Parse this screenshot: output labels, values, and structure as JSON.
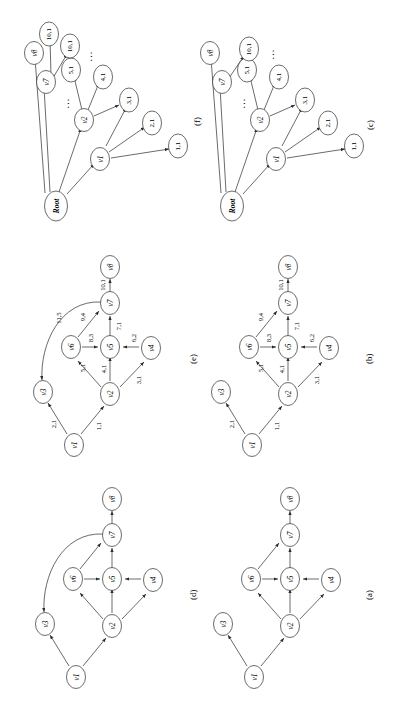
{
  "figure": {
    "orientation_degrees": -90,
    "background": "#ffffff",
    "stroke_color": "#2b2b2b",
    "panels": [
      {
        "id": "a",
        "caption": "(a)",
        "type": "directed-graph",
        "nodes": [
          "v1",
          "v2",
          "v3",
          "v4",
          "v5",
          "v6",
          "v7",
          "v8"
        ],
        "edges": [
          {
            "from": "v1",
            "to": "v3"
          },
          {
            "from": "v1",
            "to": "v2"
          },
          {
            "from": "v2",
            "to": "v6"
          },
          {
            "from": "v2",
            "to": "v5"
          },
          {
            "from": "v2",
            "to": "v4"
          },
          {
            "from": "v6",
            "to": "v5"
          },
          {
            "from": "v4",
            "to": "v5"
          },
          {
            "from": "v5",
            "to": "v7"
          },
          {
            "from": "v6",
            "to": "v7"
          },
          {
            "from": "v7",
            "to": "v8"
          }
        ]
      },
      {
        "id": "b",
        "caption": "(b)",
        "type": "weighted-directed-graph",
        "nodes": [
          "v1",
          "v2",
          "v3",
          "v4",
          "v5",
          "v6",
          "v7",
          "v8"
        ],
        "edges": [
          {
            "from": "v1",
            "to": "v3",
            "weight": "2,1"
          },
          {
            "from": "v1",
            "to": "v2",
            "weight": "1,1"
          },
          {
            "from": "v2",
            "to": "v6",
            "weight": "5,1"
          },
          {
            "from": "v2",
            "to": "v5",
            "weight": "4,1"
          },
          {
            "from": "v2",
            "to": "v4",
            "weight": "3,1"
          },
          {
            "from": "v6",
            "to": "v5",
            "weight": "8,3"
          },
          {
            "from": "v4",
            "to": "v5",
            "weight": "6,2"
          },
          {
            "from": "v5",
            "to": "v7",
            "weight": "7,1"
          },
          {
            "from": "v6",
            "to": "v7",
            "weight": "9,4"
          },
          {
            "from": "v7",
            "to": "v8",
            "weight": "10,1"
          }
        ]
      },
      {
        "id": "c",
        "caption": "(c)",
        "type": "tree",
        "root_label": "Root",
        "level1": [
          "v1",
          "v2",
          "v7",
          "v8"
        ],
        "level1_ellipsis": "...",
        "leaves_v1": [
          "1,1",
          "2,1",
          "3,1"
        ],
        "leaves_v2": [
          "3,1",
          "4,1",
          "5,1"
        ],
        "leaves_v7": [
          "10,1"
        ],
        "leaf_ellipsis": "...",
        "edges": [
          {
            "from": "Root",
            "to": "v1"
          },
          {
            "from": "Root",
            "to": "v2"
          },
          {
            "from": "Root",
            "to": "v7"
          },
          {
            "from": "Root",
            "to": "v8"
          },
          {
            "from": "v1",
            "to": "1,1"
          },
          {
            "from": "v1",
            "to": "2,1"
          },
          {
            "from": "v1",
            "to": "3,1"
          },
          {
            "from": "v2",
            "to": "3,1"
          },
          {
            "from": "v2",
            "to": "4,1"
          },
          {
            "from": "v2",
            "to": "5,1"
          },
          {
            "from": "v7",
            "to": "10,1"
          }
        ]
      },
      {
        "id": "d",
        "caption": "(d)",
        "type": "directed-graph",
        "nodes": [
          "v1",
          "v2",
          "v3",
          "v4",
          "v5",
          "v6",
          "v7",
          "v8"
        ],
        "edges": [
          {
            "from": "v1",
            "to": "v3"
          },
          {
            "from": "v1",
            "to": "v2"
          },
          {
            "from": "v2",
            "to": "v6"
          },
          {
            "from": "v2",
            "to": "v5"
          },
          {
            "from": "v2",
            "to": "v4"
          },
          {
            "from": "v6",
            "to": "v5"
          },
          {
            "from": "v4",
            "to": "v5"
          },
          {
            "from": "v5",
            "to": "v7"
          },
          {
            "from": "v6",
            "to": "v7"
          },
          {
            "from": "v7",
            "to": "v8"
          },
          {
            "from": "v7",
            "to": "v3",
            "style": "back-edge"
          }
        ]
      },
      {
        "id": "e",
        "caption": "(e)",
        "type": "weighted-directed-graph",
        "nodes": [
          "v1",
          "v2",
          "v3",
          "v4",
          "v5",
          "v6",
          "v7",
          "v8"
        ],
        "edges": [
          {
            "from": "v1",
            "to": "v3",
            "weight": "2,1"
          },
          {
            "from": "v1",
            "to": "v2",
            "weight": "1,1"
          },
          {
            "from": "v2",
            "to": "v6",
            "weight": "5,1"
          },
          {
            "from": "v2",
            "to": "v5",
            "weight": "4,1"
          },
          {
            "from": "v2",
            "to": "v4",
            "weight": "3,1"
          },
          {
            "from": "v6",
            "to": "v5",
            "weight": "8,3"
          },
          {
            "from": "v4",
            "to": "v5",
            "weight": "6,2"
          },
          {
            "from": "v5",
            "to": "v7",
            "weight": "7,1"
          },
          {
            "from": "v6",
            "to": "v7",
            "weight": "9,4"
          },
          {
            "from": "v7",
            "to": "v8",
            "weight": "10,1"
          },
          {
            "from": "v7",
            "to": "v3",
            "weight": "11,5",
            "style": "back-edge"
          }
        ]
      },
      {
        "id": "f",
        "caption": "(f)",
        "type": "tree",
        "root_label": "Root",
        "level1": [
          "v1",
          "v2",
          "v7",
          "v8"
        ],
        "level1_ellipsis": "...",
        "leaves_v1": [
          "1,1",
          "2,1",
          "3,1"
        ],
        "leaves_v2": [
          "3,1",
          "4,1",
          "5,1"
        ],
        "leaves_v7": [
          "10,1",
          "10,1"
        ],
        "leaf_ellipsis": "...",
        "edges": [
          {
            "from": "Root",
            "to": "v1"
          },
          {
            "from": "Root",
            "to": "v2"
          },
          {
            "from": "Root",
            "to": "v7"
          },
          {
            "from": "Root",
            "to": "v8"
          },
          {
            "from": "v1",
            "to": "1,1"
          },
          {
            "from": "v1",
            "to": "2,1"
          },
          {
            "from": "v1",
            "to": "3,1"
          },
          {
            "from": "v2",
            "to": "3,1"
          },
          {
            "from": "v2",
            "to": "4,1"
          },
          {
            "from": "v2",
            "to": "5,1"
          },
          {
            "from": "v7",
            "to": "10,1"
          },
          {
            "from": "v7",
            "to": "10,1"
          }
        ]
      }
    ]
  }
}
